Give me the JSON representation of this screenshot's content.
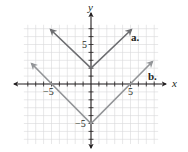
{
  "chart_data": {
    "type": "line",
    "title": "",
    "xlabel": "x",
    "ylabel": "y",
    "xlim": [
      -8.5,
      8.5
    ],
    "ylim": [
      -7.5,
      7.5
    ],
    "grid": true,
    "x_tick_labels": [
      {
        "value": -5,
        "label": "−5"
      },
      {
        "value": 5,
        "label": "5"
      }
    ],
    "y_tick_labels": [
      {
        "value": 5,
        "label": "5"
      },
      {
        "value": -5,
        "label": "−5"
      }
    ],
    "series": [
      {
        "name": "a.",
        "equation": "y = |x| + 2",
        "color": "#6d6e71",
        "x": [
          -6,
          0,
          6
        ],
        "y": [
          8,
          2,
          8
        ]
      },
      {
        "name": "b.",
        "equation": "y = |x| - 5",
        "color": "#939598",
        "x": [
          -7.5,
          0,
          7.5
        ],
        "y": [
          2.5,
          -5,
          2.5
        ]
      }
    ],
    "annotations": [
      "a.",
      "b."
    ]
  },
  "labels": {
    "x_axis": "x",
    "y_axis": "y",
    "x_neg5": "−5",
    "x_pos5": "5",
    "y_pos5": "5",
    "y_neg5": "−5",
    "series_a": "a.",
    "series_b": "b."
  }
}
